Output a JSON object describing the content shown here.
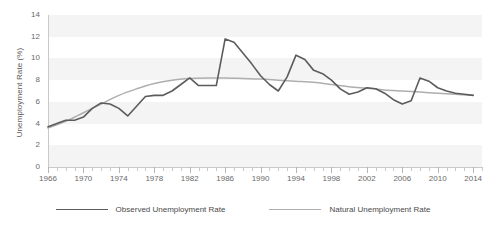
{
  "chart_data": {
    "type": "line",
    "title": "",
    "subtitle": "",
    "xlabel": "",
    "ylabel": "Unemployment Rate (%)",
    "xlim": [
      1966,
      2015
    ],
    "ylim": [
      0,
      14
    ],
    "y_ticks": [
      0,
      2,
      4,
      6,
      8,
      10,
      12,
      14
    ],
    "x_ticks": [
      1966,
      1970,
      1974,
      1978,
      1982,
      1986,
      1990,
      1994,
      1998,
      2002,
      2006,
      2010,
      2014
    ],
    "x_minor_tick_interval": 1,
    "grid": "alternating-horizontal-bands",
    "legend_position": "bottom-center",
    "series": [
      {
        "name": "Observed Unemployment Rate",
        "color": "#5c5c5c",
        "x": [
          1966,
          1967,
          1968,
          1969,
          1970,
          1971,
          1972,
          1973,
          1974,
          1975,
          1976,
          1977,
          1978,
          1979,
          1980,
          1981,
          1982,
          1983,
          1984,
          1985,
          1986,
          1987,
          1988,
          1989,
          1990,
          1991,
          1992,
          1993,
          1994,
          1995,
          1996,
          1997,
          1998,
          1999,
          2000,
          2001,
          2002,
          2003,
          2004,
          2005,
          2006,
          2007,
          2008,
          2009,
          2010,
          2011,
          2012,
          2013,
          2014,
          2015
        ],
        "values": [
          3.8,
          3.8,
          3.6,
          3.5,
          4.9,
          5.9,
          5.6,
          4.9,
          5.6,
          8.5,
          7.7,
          7.1,
          6.1,
          5.8,
          7.1,
          7.6,
          9.7,
          9.6,
          7.5,
          7.2,
          7.0,
          6.2,
          5.5,
          5.3,
          5.6,
          6.8,
          7.5,
          6.9,
          6.1,
          5.6,
          5.4,
          4.9,
          4.5,
          4.2,
          4.0,
          4.7,
          5.8,
          6.0,
          5.5,
          5.1,
          4.6,
          4.6,
          5.8,
          9.3,
          9.6,
          8.9,
          8.1,
          7.4,
          6.2,
          5.3
        ],
        "peak": {
          "year": 1982,
          "value": 11.8
        },
        "notes": "Values follow the plotted dark-grey trace; 1982-83 peak near 11.8%, 1992 peak near 10.3%, 2009-10 peak near 8.2%."
      },
      {
        "name": "Natural Unemployment Rate",
        "color": "#aeaeae",
        "x": [
          1966,
          1968,
          1970,
          1972,
          1974,
          1976,
          1978,
          1980,
          1982,
          1984,
          1986,
          1988,
          1990,
          1992,
          1994,
          1996,
          1998,
          2000,
          2002,
          2004,
          2006,
          2008,
          2010,
          2012,
          2014,
          2015
        ],
        "values": [
          3.6,
          4.1,
          4.8,
          5.6,
          6.3,
          6.9,
          7.5,
          8.0,
          8.2,
          8.2,
          8.1,
          8.1,
          8.1,
          8.1,
          8.0,
          7.9,
          7.7,
          7.5,
          7.3,
          7.2,
          7.0,
          6.9,
          6.8,
          6.7,
          6.6,
          6.5
        ],
        "notes": "Smooth light-grey curve rising from about 3.6% in 1966 to a plateau near 8.2% in the mid-1980s then easing to about 6.5% by 2015."
      }
    ],
    "observed_trace_points": [
      [
        1966,
        3.7
      ],
      [
        1967,
        4.0
      ],
      [
        1968,
        4.3
      ],
      [
        1969,
        4.3
      ],
      [
        1970,
        4.6
      ],
      [
        1971,
        5.4
      ],
      [
        1972,
        5.9
      ],
      [
        1973,
        5.8
      ],
      [
        1974,
        5.4
      ],
      [
        1975,
        4.7
      ],
      [
        1976,
        5.6
      ],
      [
        1977,
        6.5
      ],
      [
        1978,
        6.6
      ],
      [
        1979,
        6.6
      ],
      [
        1980,
        7.0
      ],
      [
        1981,
        7.6
      ],
      [
        1982,
        8.2
      ],
      [
        1983,
        7.5
      ],
      [
        1984,
        7.5
      ],
      [
        1985,
        7.5
      ],
      [
        1986,
        11.8
      ],
      [
        1987,
        11.5
      ],
      [
        1988,
        10.5
      ],
      [
        1989,
        9.5
      ],
      [
        1990,
        8.4
      ],
      [
        1991,
        7.6
      ],
      [
        1992,
        7.0
      ],
      [
        1993,
        8.3
      ],
      [
        1994,
        10.3
      ],
      [
        1995,
        9.9
      ],
      [
        1996,
        8.9
      ],
      [
        1997,
        8.6
      ],
      [
        1998,
        8.0
      ],
      [
        1999,
        7.2
      ],
      [
        2000,
        6.7
      ],
      [
        2001,
        6.9
      ],
      [
        2002,
        7.3
      ],
      [
        2003,
        7.2
      ],
      [
        2004,
        6.8
      ],
      [
        2005,
        6.2
      ],
      [
        2006,
        5.8
      ],
      [
        2007,
        6.1
      ],
      [
        2008,
        8.2
      ],
      [
        2009,
        7.9
      ],
      [
        2010,
        7.3
      ],
      [
        2011,
        7.0
      ],
      [
        2012,
        6.8
      ],
      [
        2013,
        6.7
      ],
      [
        2014,
        6.6
      ]
    ],
    "natural_trace_points": [
      [
        1966,
        3.6
      ],
      [
        1968,
        4.2
      ],
      [
        1970,
        5.0
      ],
      [
        1972,
        5.8
      ],
      [
        1974,
        6.6
      ],
      [
        1976,
        7.2
      ],
      [
        1978,
        7.7
      ],
      [
        1980,
        8.0
      ],
      [
        1982,
        8.15
      ],
      [
        1984,
        8.2
      ],
      [
        1986,
        8.2
      ],
      [
        1988,
        8.15
      ],
      [
        1990,
        8.1
      ],
      [
        1992,
        8.0
      ],
      [
        1994,
        7.9
      ],
      [
        1996,
        7.8
      ],
      [
        1998,
        7.6
      ],
      [
        2000,
        7.4
      ],
      [
        2002,
        7.25
      ],
      [
        2004,
        7.1
      ],
      [
        2006,
        7.0
      ],
      [
        2008,
        6.9
      ],
      [
        2010,
        6.8
      ],
      [
        2012,
        6.7
      ],
      [
        2014,
        6.6
      ]
    ]
  },
  "axes": {
    "y_title": "Unemployment Rate (%)",
    "y_tick_labels": [
      "14",
      "12",
      "10",
      "8",
      "6",
      "4",
      "2",
      "0"
    ],
    "x_tick_labels": [
      "1966",
      "1970",
      "1974",
      "1978",
      "1982",
      "1986",
      "1990",
      "1994",
      "1998",
      "2002",
      "2006",
      "2010",
      "2014"
    ]
  },
  "legend": {
    "items": [
      {
        "label": "Observed Unemployment Rate",
        "color": "#5c5c5c"
      },
      {
        "label": "Natural Unemployment Rate",
        "color": "#aeaeae"
      }
    ]
  },
  "colors": {
    "observed": "#5c5c5c",
    "natural": "#aeaeae",
    "band": "#f4f4f4",
    "axis": "#c9c9c9",
    "text": "#5a5a5a",
    "background": "#ffffff"
  }
}
